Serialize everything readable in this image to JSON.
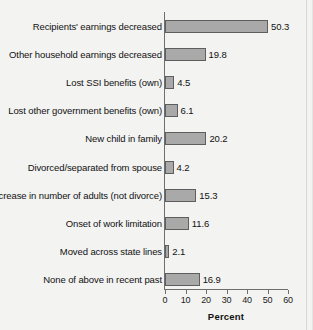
{
  "chart_data": {
    "type": "bar",
    "orientation": "horizontal",
    "title": "",
    "xlabel": "Percent",
    "ylabel": "",
    "xlim": [
      0,
      60
    ],
    "xticks": [
      0,
      10,
      20,
      30,
      40,
      50,
      60
    ],
    "grid": false,
    "legend": null,
    "bar_fill_color": "#a9a9a9",
    "bar_edge_color": "#5e5e5e",
    "categories": [
      "Recipients' earnings decreased",
      "Other household earnings decreased",
      "Lost SSI benefits (own)",
      "Lost other government benefits (own)",
      "New child in family",
      "Divorced/separated from spouse",
      "Decrease in number of adults (not divorce)",
      "Onset of work limitation",
      "Moved across state lines",
      "None of above in recent past"
    ],
    "values": [
      50.3,
      19.8,
      4.5,
      6.1,
      20.2,
      4.2,
      15.3,
      11.6,
      2.1,
      16.9
    ],
    "value_labels": [
      "50.3",
      "19.8",
      "4.5",
      "6.1",
      "20.2",
      "4.2",
      "15.3",
      "11.6",
      "2.1",
      "16.9"
    ]
  }
}
